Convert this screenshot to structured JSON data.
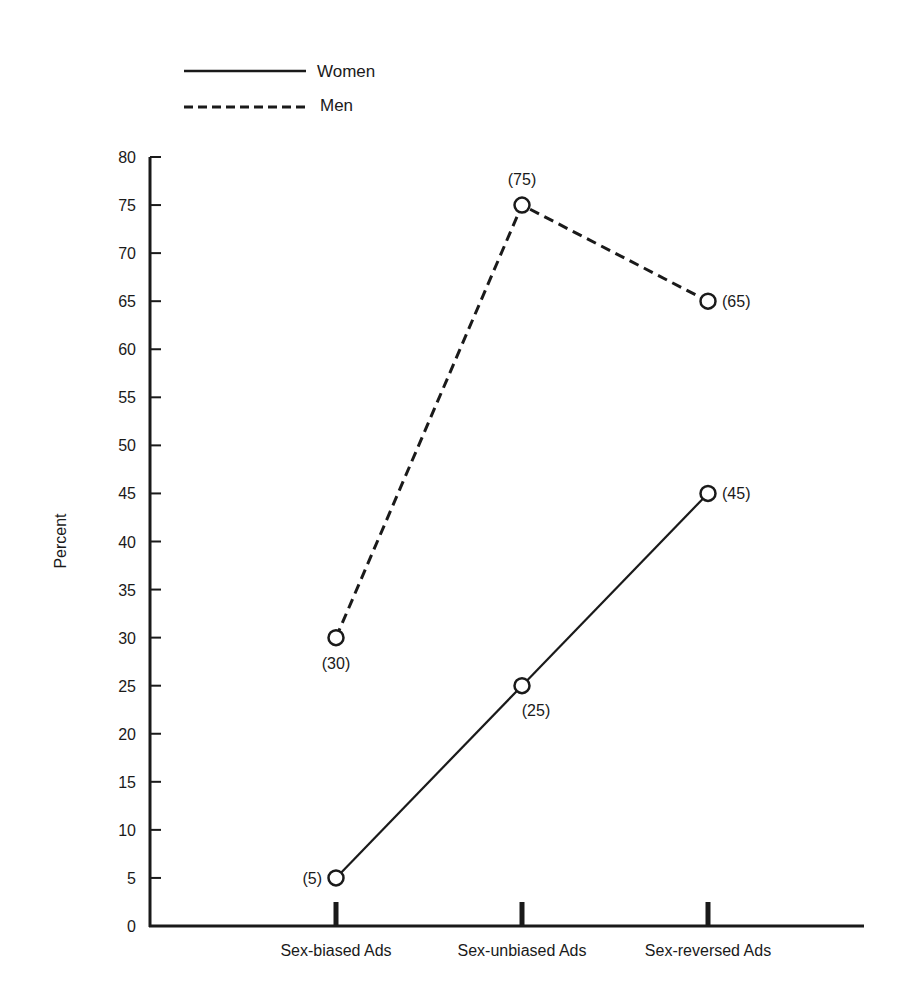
{
  "chart_data": {
    "type": "line",
    "title": "",
    "xlabel": "",
    "ylabel": "Percent",
    "ylim": [
      0,
      80
    ],
    "yticks": [
      0,
      5,
      10,
      15,
      20,
      25,
      30,
      35,
      40,
      45,
      50,
      55,
      60,
      65,
      70,
      75,
      80
    ],
    "grid": false,
    "legend_position": "top-left",
    "categories": [
      "Sex-biased Ads",
      "Sex-unbiased Ads",
      "Sex-reversed Ads"
    ],
    "series": [
      {
        "name": "Women",
        "style": "solid",
        "values": [
          5,
          25,
          45
        ],
        "labels": [
          "(5)",
          "(25)",
          "(45)"
        ]
      },
      {
        "name": "Men",
        "style": "dashed",
        "values": [
          30,
          75,
          65
        ],
        "labels": [
          "(30)",
          "(75)",
          "(65)"
        ]
      }
    ]
  },
  "legend": {
    "items": [
      {
        "label": "Women",
        "style": "solid"
      },
      {
        "label": "Men",
        "style": "dashed"
      }
    ]
  },
  "axes": {
    "y_label": "Percent",
    "y_tick_labels": [
      "0",
      "5",
      "10",
      "15",
      "20",
      "25",
      "30",
      "35",
      "40",
      "45",
      "50",
      "55",
      "60",
      "65",
      "70",
      "75",
      "80"
    ],
    "x_tick_labels": [
      "Sex-biased Ads",
      "Sex-unbiased Ads",
      "Sex-reversed Ads"
    ]
  },
  "colors": {
    "ink": "#1a1a1a",
    "background": "#ffffff"
  }
}
